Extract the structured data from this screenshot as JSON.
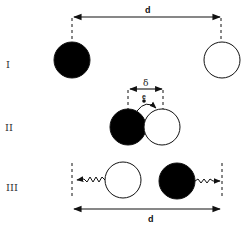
{
  "diagram": {
    "stages": [
      {
        "label": "I",
        "description": "particles separated by distance d"
      },
      {
        "label": "II",
        "description": "particles in contact, separation delta, electron transfer"
      },
      {
        "label": "III",
        "description": "charged particles separate to distance d"
      }
    ],
    "labels": {
      "d_top": "d",
      "delta": "δ",
      "electron": "e",
      "d_bottom": "d"
    },
    "colors": {
      "filled": "#000000",
      "empty": "#ffffff",
      "stroke": "#111111"
    }
  }
}
